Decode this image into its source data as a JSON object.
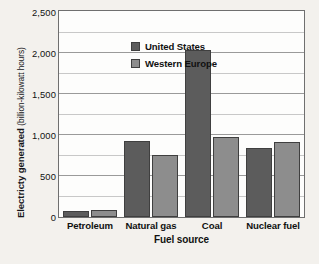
{
  "chart_data": {
    "type": "bar",
    "title": "",
    "xlabel": "Fuel source",
    "ylabel": "Electricty generated (billion-kilowatt hours)",
    "ylabel_main": "Electricty generated",
    "ylabel_units": "(billion-kilowatt hours)",
    "categories": [
      "Petroleum",
      "Natural gas",
      "Coal",
      "Nuclear fuel"
    ],
    "series": [
      {
        "name": "United States",
        "color": "#5c5c5c",
        "values": [
          70,
          930,
          2040,
          840
        ]
      },
      {
        "name": "Western Europe",
        "color": "#8d8d8d",
        "values": [
          90,
          760,
          980,
          920
        ]
      }
    ],
    "ylim": [
      0,
      2500
    ],
    "ytick_labels": [
      "2,500",
      "2,000",
      "1,500",
      "1,000",
      "500",
      "0"
    ],
    "ytick_values": [
      2500,
      2000,
      1500,
      1000,
      500,
      0
    ],
    "minor_gridline_values": [
      2250,
      1750,
      1250,
      750,
      250
    ],
    "grid": true,
    "legend_position": "upper-left-inside"
  },
  "colors": {
    "page_background": "#f3f1ed",
    "plot_background": "#fdfdfc",
    "axis": "#6f6f6f",
    "gridline_major": "#9a9a9a",
    "gridline_minor": "#c8c8c8",
    "text": "#111111"
  }
}
